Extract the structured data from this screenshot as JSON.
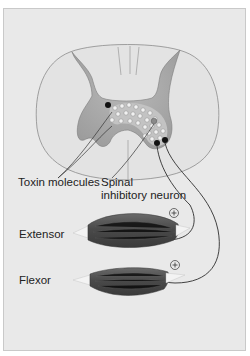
{
  "figure": {
    "type": "spinal-cord-reflex-diagram",
    "background": "#e9e9e9",
    "colors": {
      "white_matter": "#e2e2e2",
      "gray_matter": "#a9a9a9",
      "toxin_dot_fill": "#eeeeee",
      "neuron_body": "#111111",
      "muscle": "#5a5a5a",
      "tendon": "#f2f2f2",
      "nerve_line": "#333333"
    }
  },
  "labels": {
    "toxin": "Toxin molecules",
    "spinal_line1": "Spinal",
    "spinal_line2": "inhibitory neuron",
    "extensor": "Extensor",
    "flexor": "Flexor"
  },
  "symbols": {
    "extensor_sign": "+",
    "flexor_sign": "+"
  }
}
